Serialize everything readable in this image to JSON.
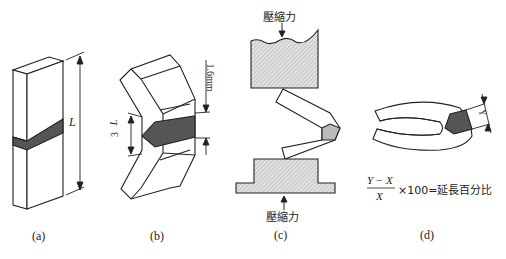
{
  "panels": [
    {
      "id": "a",
      "caption": "(a)",
      "dimension_label": "L"
    },
    {
      "id": "b",
      "caption": "(b)",
      "dimension_label_top": "L",
      "dimension_label_bottom": "3",
      "thickness_label": "1.6mm"
    },
    {
      "id": "c",
      "caption": "(c)",
      "force_top": "壓縮力",
      "force_bottom": "壓縮力"
    },
    {
      "id": "d",
      "caption": "(d)",
      "dimension_label": "Y",
      "formula": {
        "numerator": "Y − X",
        "denominator": "X",
        "rhs": "×100=延長百分比"
      }
    }
  ],
  "colors": {
    "line": "#222222",
    "weld": "#555555",
    "hatch": "#cccccc",
    "background": "#ffffff"
  }
}
